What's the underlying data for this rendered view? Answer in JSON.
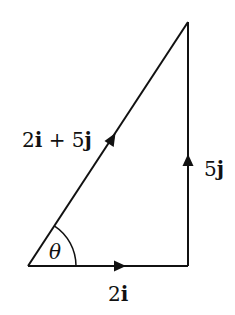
{
  "diagram": {
    "type": "vector-triangle",
    "vertices": {
      "origin": [
        28,
        266
      ],
      "right_angle": [
        188,
        266
      ],
      "apex": [
        188,
        22
      ]
    },
    "edges": [
      {
        "id": "horizontal",
        "from": "origin",
        "to": "right_angle",
        "label": "2i",
        "direction": "right"
      },
      {
        "id": "vertical",
        "from": "right_angle",
        "to": "apex",
        "label": "5j",
        "direction": "up"
      },
      {
        "id": "resultant",
        "from": "origin",
        "to": "apex",
        "label": "2i + 5j",
        "direction": "up-right"
      }
    ],
    "angle": {
      "label": "θ",
      "at": "origin",
      "between": [
        "horizontal",
        "resultant"
      ]
    },
    "labels": {
      "resultant_coef_i": "2",
      "resultant_i": "i",
      "resultant_plus": " + ",
      "resultant_coef_j": "5",
      "resultant_j": "j",
      "vertical_coef": "5",
      "vertical_unit": "j",
      "horizontal_coef": "2",
      "horizontal_unit": "i",
      "angle": "θ"
    },
    "colors": {
      "stroke": "#111111",
      "background": "#ffffff"
    }
  }
}
